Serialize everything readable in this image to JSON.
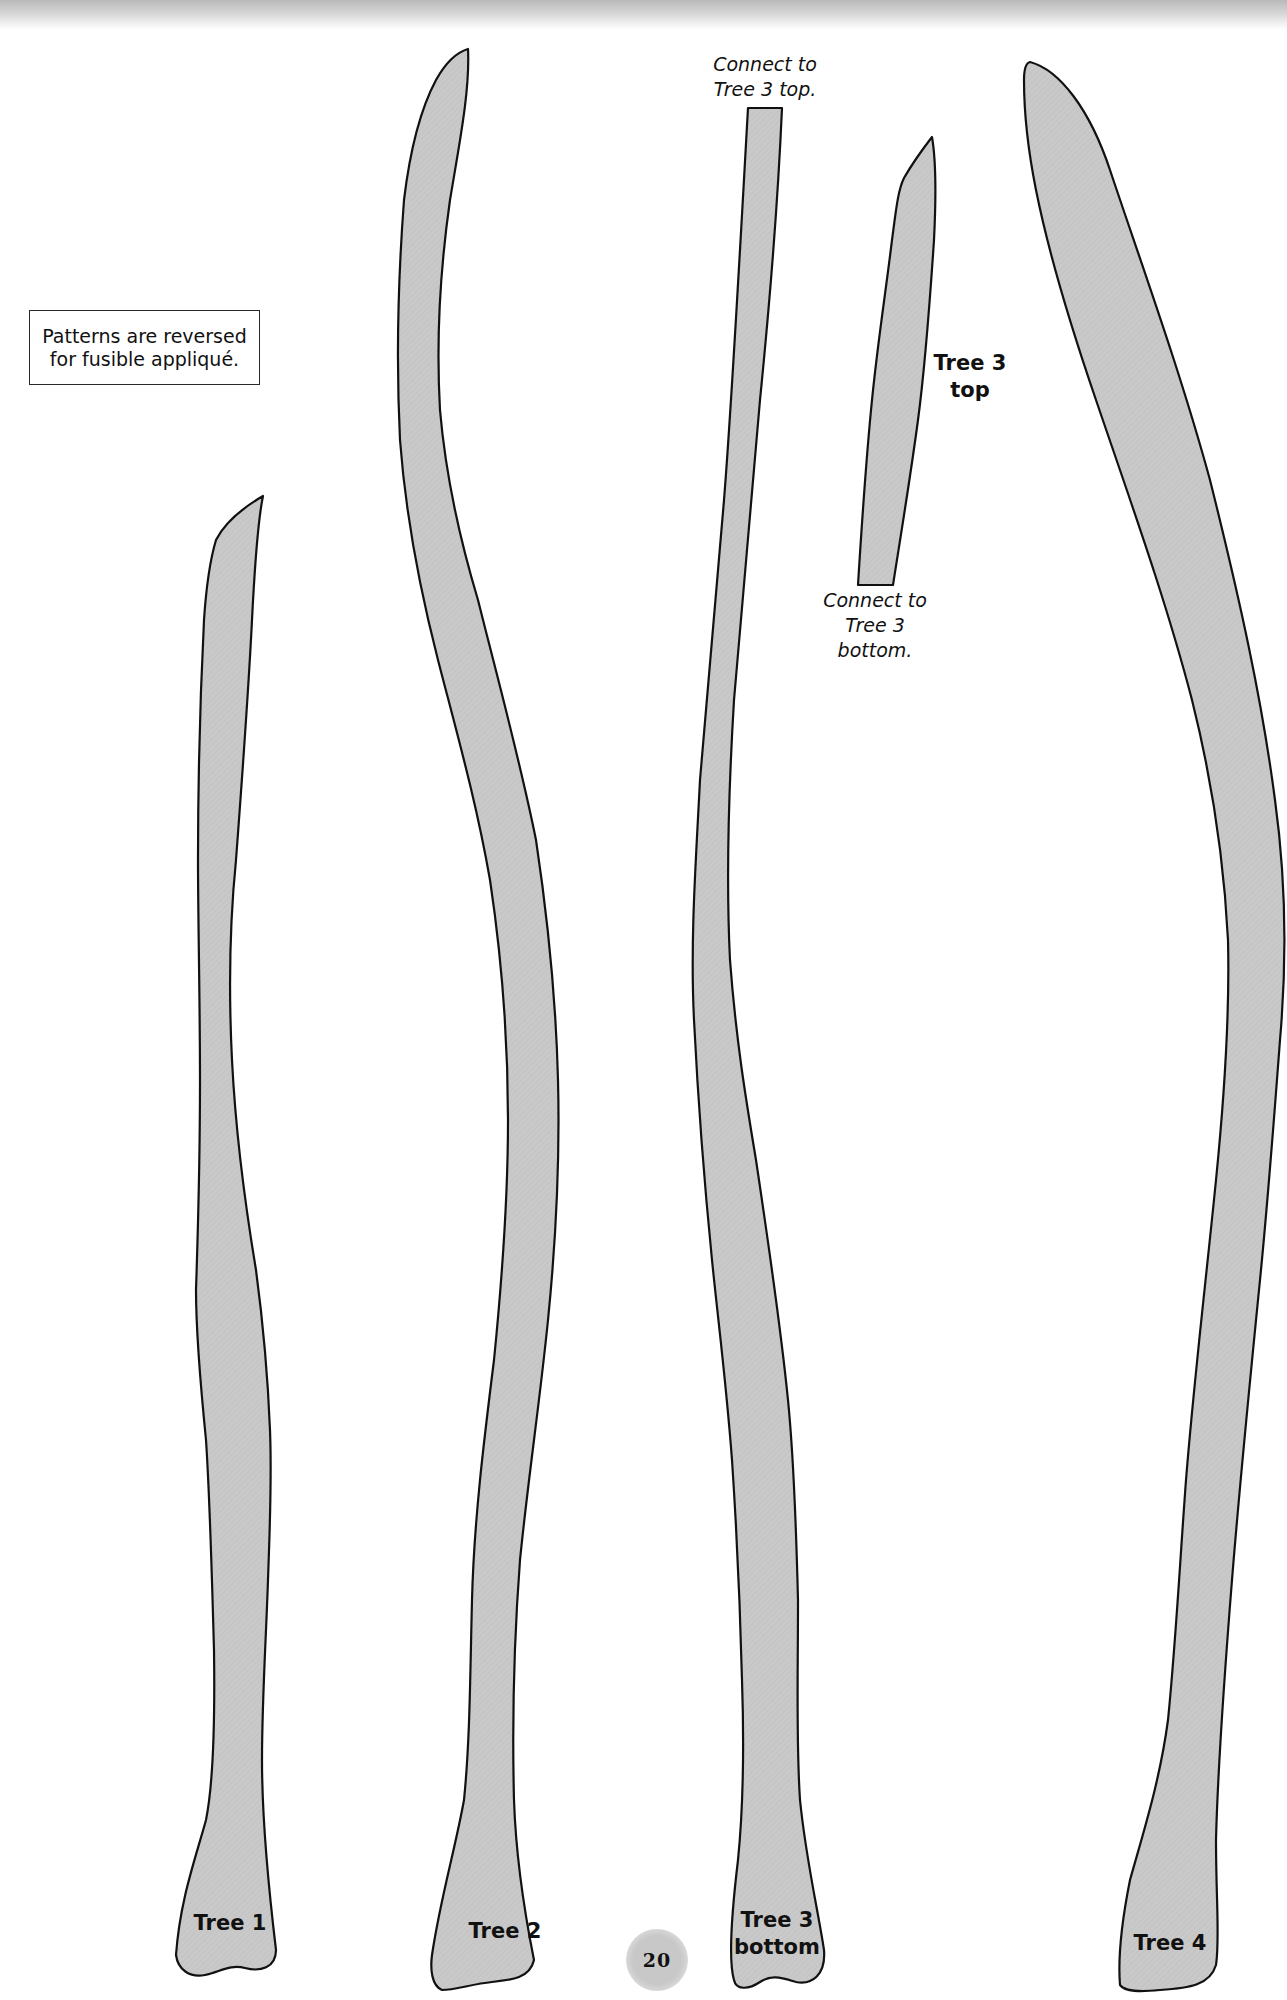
{
  "page": {
    "number": "20",
    "note": {
      "line1": "Patterns are reversed",
      "line2": "for fusible appliqué."
    }
  },
  "pattern_pieces": [
    {
      "id": "tree1",
      "label_line1": "Tree 1",
      "label_line2": ""
    },
    {
      "id": "tree2",
      "label_line1": "Tree 2",
      "label_line2": ""
    },
    {
      "id": "tree3-bottom",
      "label_line1": "Tree 3",
      "label_line2": "bottom"
    },
    {
      "id": "tree3-top",
      "label_line1": "Tree 3",
      "label_line2": "top"
    },
    {
      "id": "tree4",
      "label_line1": "Tree 4",
      "label_line2": ""
    }
  ],
  "connectors": {
    "to_top": {
      "line1": "Connect to",
      "line2": "Tree 3 top."
    },
    "to_bottom": {
      "line1": "Connect to",
      "line2": "Tree 3",
      "line3": "bottom."
    }
  },
  "colors": {
    "fill": "#c9c9c9",
    "outline": "#111111",
    "paper": "#ffffff"
  }
}
